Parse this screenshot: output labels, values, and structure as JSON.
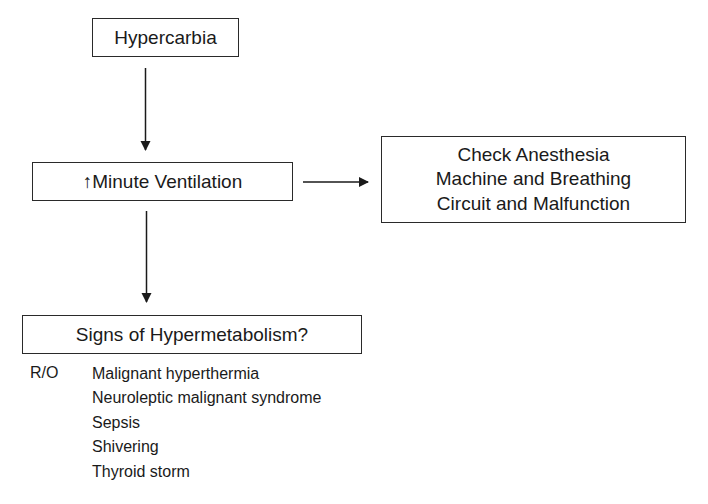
{
  "flowchart": {
    "nodes": [
      {
        "id": "hypercarbia",
        "label": "Hypercarbia"
      },
      {
        "id": "minute_ventilation",
        "arrow_glyph": "↑",
        "label": "Minute Ventilation"
      },
      {
        "id": "check_machine",
        "lines": [
          "Check Anesthesia",
          "Machine and Breathing",
          "Circuit and Malfunction"
        ]
      },
      {
        "id": "hypermetabolism",
        "label": "Signs of Hypermetabolism?"
      }
    ],
    "edges": [
      {
        "from": "hypercarbia",
        "to": "minute_ventilation",
        "direction": "down"
      },
      {
        "from": "minute_ventilation",
        "to": "check_machine",
        "direction": "right"
      },
      {
        "from": "minute_ventilation",
        "to": "hypermetabolism",
        "direction": "down"
      }
    ],
    "rule_out": {
      "label": "R/O",
      "items": [
        "Malignant hyperthermia",
        "Neuroleptic malignant syndrome",
        "Sepsis",
        "Shivering",
        "Thyroid storm"
      ]
    }
  },
  "colors": {
    "line": "#2a2a2a",
    "text": "#1a1a1a",
    "background": "#ffffff"
  }
}
